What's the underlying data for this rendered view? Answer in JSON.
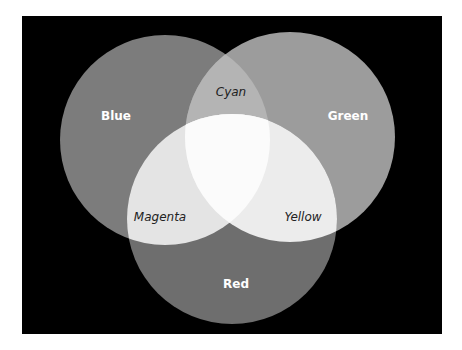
{
  "diagram": {
    "type": "venn-additive-color",
    "background": "#000000",
    "circles": [
      {
        "name": "Blue",
        "cx": 165,
        "cy": 140,
        "r": 105,
        "fill": "#7c7c7c"
      },
      {
        "name": "Green",
        "cx": 290,
        "cy": 137,
        "r": 105,
        "fill": "#9c9c9c"
      },
      {
        "name": "Red",
        "cx": 232,
        "cy": 219,
        "r": 105,
        "fill": "#6e6e6e"
      }
    ],
    "overlap_colors": {
      "cyan": "#b4b4b4",
      "magenta": "#e4e4e4",
      "yellow": "#ececec",
      "white": "#fbfbfb"
    },
    "labels": {
      "blue": "Blue",
      "green": "Green",
      "red": "Red",
      "cyan": "Cyan",
      "magenta": "Magenta",
      "yellow": "Yellow"
    }
  }
}
